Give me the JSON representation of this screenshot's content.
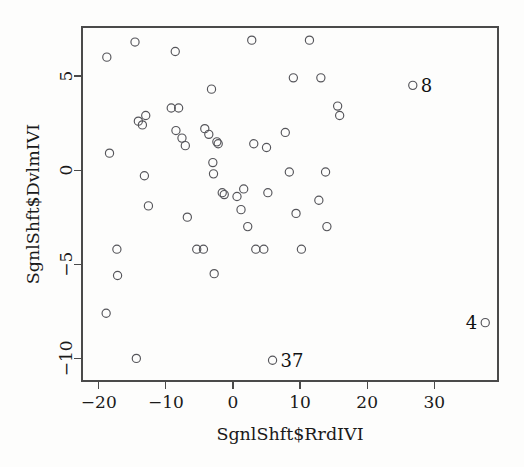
{
  "chart_data": {
    "type": "scatter",
    "title": "",
    "subtitle": "",
    "xlabel": "SgnlShft$RrdIVI",
    "ylabel": "SgnlShft$DvlmIVI",
    "xlim": [
      -22.5,
      39.5
    ],
    "ylim": [
      -11.2,
      7.6
    ],
    "xticks": [
      -20,
      -10,
      0,
      10,
      20,
      30
    ],
    "yticks": [
      5,
      0,
      -5,
      -10
    ],
    "xtick_labels": [
      "−20",
      "−10",
      "0",
      "10",
      "20",
      "30"
    ],
    "ytick_labels": [
      "5",
      "0",
      "−5",
      "−10"
    ],
    "grid": false,
    "legend": null,
    "legend_position": "none",
    "marker": "open-circle",
    "marker_color": "#55555a",
    "background_color": "#fdfdfc",
    "axis_color": "#4a4a4a",
    "box_frame": true,
    "points": [
      {
        "x": -18.8,
        "y": 6.0
      },
      {
        "x": -18.4,
        "y": 0.9
      },
      {
        "x": -18.9,
        "y": -7.6
      },
      {
        "x": -17.3,
        "y": -4.2
      },
      {
        "x": -17.2,
        "y": -5.6
      },
      {
        "x": -14.6,
        "y": 6.8
      },
      {
        "x": -14.4,
        "y": -10.0
      },
      {
        "x": -14.1,
        "y": 2.6
      },
      {
        "x": -13.5,
        "y": 2.4
      },
      {
        "x": -13.0,
        "y": 2.9
      },
      {
        "x": -13.2,
        "y": -0.3
      },
      {
        "x": -12.6,
        "y": -1.9
      },
      {
        "x": -9.2,
        "y": 3.3
      },
      {
        "x": -8.1,
        "y": 3.3
      },
      {
        "x": -8.6,
        "y": 6.3
      },
      {
        "x": -8.5,
        "y": 2.1
      },
      {
        "x": -7.6,
        "y": 1.7
      },
      {
        "x": -7.1,
        "y": 1.3
      },
      {
        "x": -6.8,
        "y": -2.5
      },
      {
        "x": -5.4,
        "y": -4.2
      },
      {
        "x": -4.4,
        "y": -4.2
      },
      {
        "x": -4.2,
        "y": 2.2
      },
      {
        "x": -3.6,
        "y": 1.9
      },
      {
        "x": -3.2,
        "y": 4.3
      },
      {
        "x": -3.0,
        "y": 0.4
      },
      {
        "x": -2.9,
        "y": -0.2
      },
      {
        "x": -2.8,
        "y": -5.5
      },
      {
        "x": -2.4,
        "y": 1.5
      },
      {
        "x": -2.2,
        "y": 1.4
      },
      {
        "x": -1.6,
        "y": -1.2
      },
      {
        "x": -1.3,
        "y": -1.3
      },
      {
        "x": 0.6,
        "y": -1.4
      },
      {
        "x": 1.2,
        "y": -2.1
      },
      {
        "x": 1.6,
        "y": -1.0
      },
      {
        "x": 2.2,
        "y": -3.0
      },
      {
        "x": 2.8,
        "y": 6.9
      },
      {
        "x": 3.1,
        "y": 1.4
      },
      {
        "x": 3.4,
        "y": -4.2
      },
      {
        "x": 4.6,
        "y": -4.2
      },
      {
        "x": 5.0,
        "y": 1.2
      },
      {
        "x": 5.2,
        "y": -1.2
      },
      {
        "x": 5.9,
        "y": -10.1,
        "label": "37"
      },
      {
        "x": 7.8,
        "y": 2.0
      },
      {
        "x": 8.4,
        "y": -0.1
      },
      {
        "x": 9.0,
        "y": 4.9
      },
      {
        "x": 9.4,
        "y": -2.3
      },
      {
        "x": 10.2,
        "y": -4.2
      },
      {
        "x": 11.4,
        "y": 6.9
      },
      {
        "x": 12.8,
        "y": -1.6
      },
      {
        "x": 13.1,
        "y": 4.9
      },
      {
        "x": 13.8,
        "y": -0.1
      },
      {
        "x": 14.0,
        "y": -3.0
      },
      {
        "x": 15.6,
        "y": 3.4
      },
      {
        "x": 15.9,
        "y": 2.9
      },
      {
        "x": 26.8,
        "y": 4.5,
        "label": "8"
      },
      {
        "x": 37.6,
        "y": -8.1,
        "label": "4"
      }
    ],
    "labeled_points": [
      {
        "id": "8",
        "x": 26.8,
        "y": 4.5,
        "label_side": "right"
      },
      {
        "id": "4",
        "x": 37.6,
        "y": -8.1,
        "label_side": "left"
      },
      {
        "id": "37",
        "x": 5.9,
        "y": -10.1,
        "label_side": "right"
      }
    ]
  }
}
